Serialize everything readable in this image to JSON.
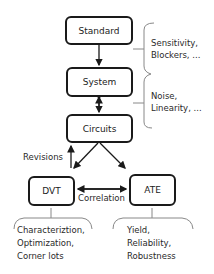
{
  "nodes": {
    "standard": "Standard",
    "system": "System",
    "circuits": "Circuits",
    "dvt": "DVT",
    "ate": "ATE"
  },
  "edge_labels": {
    "revisions": "Revisions",
    "correlation": "Correlation"
  },
  "annotations": {
    "standard_system": [
      "Sensitivity,",
      "Blockers, ..."
    ],
    "system_circuits": [
      "Noise,",
      "Linearity, ..."
    ],
    "dvt": [
      "Characteriztion,",
      "Optimization,",
      "Corner lots"
    ],
    "ate": [
      "Yield,",
      "Reliability,",
      "Robustness"
    ]
  }
}
